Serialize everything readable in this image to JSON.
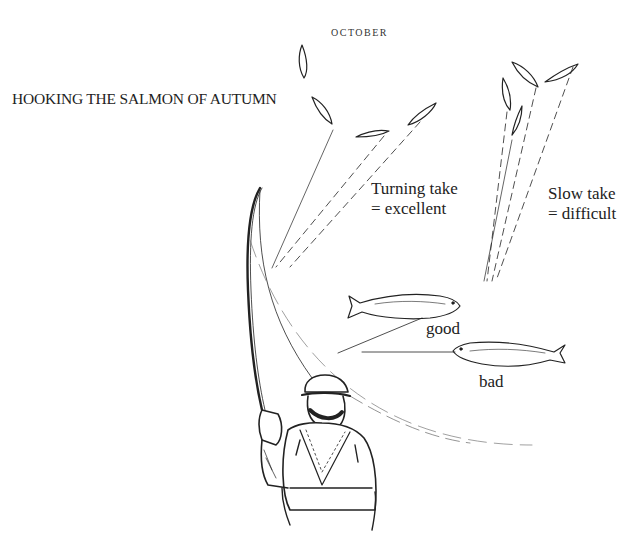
{
  "figure": {
    "title": "HOOKING THE SALMON OF AUTUMN",
    "month": "OCTOBER",
    "annotations": {
      "turning_take": [
        "Turning take",
        "= excellent"
      ],
      "slow_take": [
        "Slow take",
        "= difficult"
      ],
      "good": "good",
      "bad": "bad"
    },
    "colors": {
      "ink": "#222222",
      "background": "#ffffff"
    }
  }
}
